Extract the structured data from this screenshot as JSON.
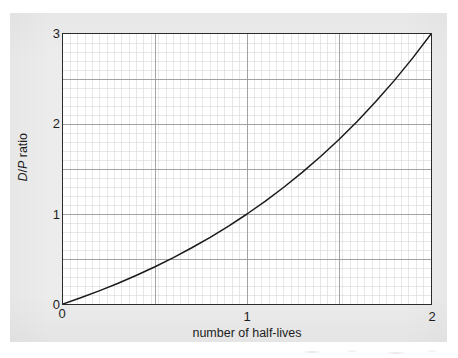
{
  "figure": {
    "panel_color": "#ececec",
    "plot_background": "#ffffff",
    "axis_color": "#2b2b2b",
    "curve_color": "#1a1a1a",
    "major_grid_color": "#9a9a9a",
    "minor_grid_color": "#d7d7d7"
  },
  "axes": {
    "x": {
      "label": "number of half-lives",
      "ticks": [
        "0",
        "1",
        "2"
      ],
      "tick_values": [
        0,
        1,
        2
      ],
      "min": 0,
      "max": 2
    },
    "y": {
      "label_prefix": "D",
      "label_slash": "/",
      "label_mid": "P",
      "label_suffix": " ratio",
      "label_plain": "D/P ratio",
      "ticks": [
        "0",
        "1",
        "2",
        "3"
      ],
      "tick_values": [
        0,
        1,
        2,
        3
      ],
      "min": 0,
      "max": 3
    }
  },
  "chart_data": {
    "type": "line",
    "title": "",
    "subtitle": "",
    "xlabel": "number of half-lives",
    "ylabel": "D/P ratio",
    "xlim": [
      0,
      2
    ],
    "ylim": [
      0,
      3
    ],
    "grid": true,
    "grid_major_x_step": 0.5,
    "grid_major_y_step": 0.5,
    "grid_minor_x_step": 0.04,
    "grid_minor_y_step": 0.1,
    "legend": null,
    "legend_position": "none",
    "annotations": [],
    "series": [
      {
        "name": "D/P ratio",
        "formula": "D/P = 2^t - 1",
        "color": "#1a1a1a",
        "x": [
          0,
          0.1,
          0.2,
          0.3,
          0.4,
          0.5,
          0.6,
          0.7,
          0.8,
          0.9,
          1.0,
          1.1,
          1.2,
          1.3,
          1.4,
          1.5,
          1.6,
          1.7,
          1.8,
          1.9,
          2.0
        ],
        "values": [
          0,
          0.072,
          0.149,
          0.231,
          0.32,
          0.414,
          0.516,
          0.625,
          0.741,
          0.866,
          1.0,
          1.143,
          1.297,
          1.462,
          1.639,
          1.828,
          2.031,
          2.249,
          2.482,
          2.732,
          3.0
        ]
      }
    ]
  },
  "tick_labels": {
    "y3": "3",
    "y2": "2",
    "y1": "1",
    "y0": "0",
    "x0": "0",
    "x1": "1",
    "x2": "2"
  }
}
